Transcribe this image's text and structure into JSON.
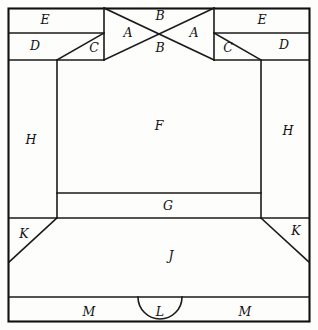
{
  "figure": {
    "canvas": {
      "width": 318,
      "height": 330
    },
    "colors": {
      "background": "#fdfdfc",
      "stroke": "#1a1a1a",
      "frame": "#111111",
      "label": "#111111"
    },
    "labels": [
      {
        "id": "label-e-left",
        "text": "E",
        "x": 45,
        "y": 20
      },
      {
        "id": "label-a-left",
        "text": "A",
        "x": 128,
        "y": 33
      },
      {
        "id": "label-b-top",
        "text": "B",
        "x": 160,
        "y": 16
      },
      {
        "id": "label-a-right",
        "text": "A",
        "x": 194,
        "y": 33
      },
      {
        "id": "label-e-right",
        "text": "E",
        "x": 262,
        "y": 20
      },
      {
        "id": "label-d-left",
        "text": "D",
        "x": 35,
        "y": 46
      },
      {
        "id": "label-c-left",
        "text": "C",
        "x": 94,
        "y": 48
      },
      {
        "id": "label-b-bottom",
        "text": "B",
        "x": 160,
        "y": 48
      },
      {
        "id": "label-c-right",
        "text": "C",
        "x": 228,
        "y": 48
      },
      {
        "id": "label-d-right",
        "text": "D",
        "x": 284,
        "y": 45
      },
      {
        "id": "label-h-left",
        "text": "H",
        "x": 31,
        "y": 140
      },
      {
        "id": "label-f",
        "text": "F",
        "x": 159,
        "y": 126
      },
      {
        "id": "label-h-right",
        "text": "H",
        "x": 288,
        "y": 131
      },
      {
        "id": "label-g",
        "text": "G",
        "x": 168,
        "y": 206
      },
      {
        "id": "label-k-left",
        "text": "K",
        "x": 24,
        "y": 234
      },
      {
        "id": "label-k-right",
        "text": "K",
        "x": 296,
        "y": 231
      },
      {
        "id": "label-j",
        "text": "J",
        "x": 171,
        "y": 256
      },
      {
        "id": "label-m-left",
        "text": "M",
        "x": 89,
        "y": 312
      },
      {
        "id": "label-l",
        "text": "L",
        "x": 160,
        "y": 312
      },
      {
        "id": "label-m-right",
        "text": "M",
        "x": 245,
        "y": 312
      }
    ],
    "regions": [
      {
        "id": "region-a-left",
        "letter": "A",
        "shape": "triangle"
      },
      {
        "id": "region-a-right",
        "letter": "A",
        "shape": "triangle"
      },
      {
        "id": "region-b-top",
        "letter": "B",
        "shape": "triangle"
      },
      {
        "id": "region-b-bottom",
        "letter": "B",
        "shape": "triangle"
      },
      {
        "id": "region-c-left",
        "letter": "C",
        "shape": "triangle"
      },
      {
        "id": "region-c-right",
        "letter": "C",
        "shape": "triangle"
      },
      {
        "id": "region-d-left",
        "letter": "D",
        "shape": "rectangle"
      },
      {
        "id": "region-d-right",
        "letter": "D",
        "shape": "rectangle"
      },
      {
        "id": "region-e-left",
        "letter": "E",
        "shape": "rectangle"
      },
      {
        "id": "region-e-right",
        "letter": "E",
        "shape": "rectangle"
      },
      {
        "id": "region-f",
        "letter": "F",
        "shape": "rectangle"
      },
      {
        "id": "region-g",
        "letter": "G",
        "shape": "rectangle"
      },
      {
        "id": "region-h-left",
        "letter": "H",
        "shape": "rectangle"
      },
      {
        "id": "region-h-right",
        "letter": "H",
        "shape": "rectangle"
      },
      {
        "id": "region-j",
        "letter": "J",
        "shape": "trapezoid"
      },
      {
        "id": "region-k-left",
        "letter": "K",
        "shape": "triangle"
      },
      {
        "id": "region-k-right",
        "letter": "K",
        "shape": "triangle"
      },
      {
        "id": "region-l",
        "letter": "L",
        "shape": "semicircle"
      },
      {
        "id": "region-m-left",
        "letter": "M",
        "shape": "rectangle"
      },
      {
        "id": "region-m-right",
        "letter": "M",
        "shape": "rectangle"
      }
    ]
  }
}
